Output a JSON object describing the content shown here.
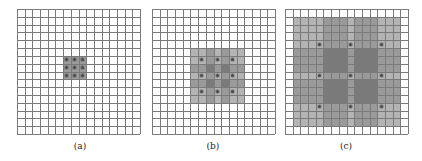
{
  "figure": {
    "grid_size": 16,
    "panels": [
      {
        "id": "a",
        "caption": "(a)",
        "left": 17,
        "caption_left": 60,
        "field_size": 1,
        "dot_cells": [
          6,
          7,
          8
        ],
        "note": "3x3 shaded block with a dot in every cell"
      },
      {
        "id": "b",
        "caption": "(b)",
        "left": 152,
        "caption_left": 193,
        "field_size": 3,
        "dot_cells": [
          6,
          8,
          10
        ],
        "note": "7x7 shaded block, dots every 2 cells, overlap shading"
      },
      {
        "id": "c",
        "caption": "(c)",
        "left": 285,
        "caption_left": 326,
        "field_size": 7,
        "dot_cells": [
          4,
          8,
          12
        ],
        "note": "large overlapping fields covering nearly the whole grid"
      }
    ],
    "colors": {
      "grid_line": "#7a7a7a",
      "shade_levels": [
        "#ffffff",
        "#b4b4b4",
        "#9a9a9a",
        "#888888",
        "#7a7a7a"
      ],
      "dot": "#4a4a4a"
    }
  }
}
